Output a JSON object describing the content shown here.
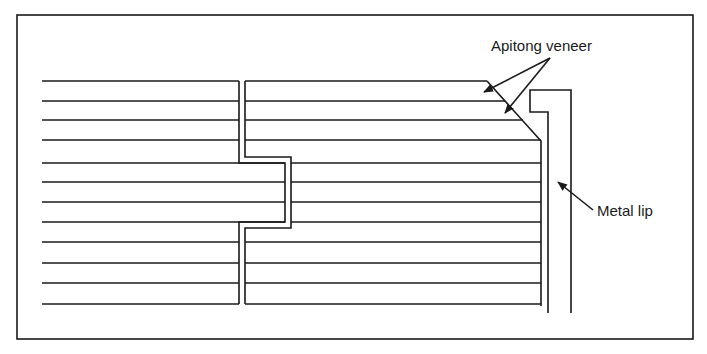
{
  "figure": {
    "type": "technical-cross-section",
    "colors": {
      "line": "#1a1a1a",
      "background": "#ffffff"
    }
  },
  "labels": {
    "apitong_veneer": "Apitong veneer",
    "metal_lip": "Metal lip"
  },
  "geometry": {
    "frame": {
      "x1": 17,
      "y1": 15,
      "x2": 693,
      "y2": 339
    },
    "laminate_rows_y": [
      81,
      101,
      120,
      140,
      163,
      182,
      202,
      222,
      242,
      263,
      283,
      304
    ],
    "left_piece_x_start": 42,
    "joint": {
      "left_x": 239,
      "right_x": 245,
      "tongue_left_x": 285,
      "tongue_right_x": 291,
      "step_top_y": 157,
      "step_bottom_y": 227
    },
    "panel_right_edge_x": 541,
    "chamfer": {
      "x1": 487,
      "y1": 81,
      "x2": 541,
      "y2": 141
    },
    "metal_lip": {
      "outer_left_x": 530,
      "outer_right_x": 571,
      "top_y": 90,
      "flange_y": 112,
      "inner_x": 548,
      "bottom_y": 313
    }
  }
}
